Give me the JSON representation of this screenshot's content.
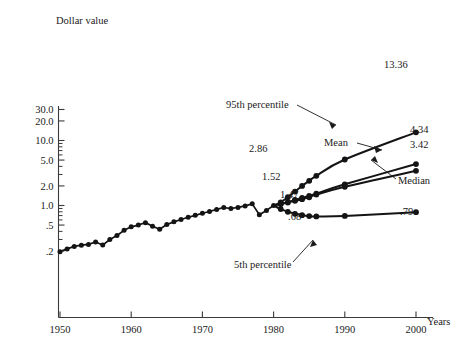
{
  "chart_data": {
    "type": "line",
    "title": "",
    "ylabel": "Dollar value",
    "xlabel": "Years",
    "yscale": "log",
    "ylim": [
      0.17,
      34.0
    ],
    "xlim": [
      1948.5,
      2002.0
    ],
    "grid": false,
    "legend": "annotations",
    "yticks": [
      {
        "value": 30.0,
        "label": "30.0"
      },
      {
        "value": 20.0,
        "label": "20.0"
      },
      {
        "value": 10.0,
        "label": "10.0"
      },
      {
        "value": 5.0,
        "label": "5.0"
      },
      {
        "value": 2.0,
        "label": "2.0"
      },
      {
        "value": 1.0,
        "label": "1.0"
      },
      {
        "value": 0.5,
        "label": ".5"
      },
      {
        "value": 0.2,
        "label": ".2"
      }
    ],
    "yminorticks": [
      9.0,
      8.0,
      7.0,
      6.0,
      4.0,
      3.0,
      0.9,
      0.8,
      0.7,
      0.6,
      0.4,
      0.3
    ],
    "xticks": [
      {
        "value": 1950,
        "label": "1950"
      },
      {
        "value": 1960,
        "label": "1960"
      },
      {
        "value": 1970,
        "label": "1970"
      },
      {
        "value": 1980,
        "label": "1980"
      },
      {
        "value": 1990,
        "label": "1990"
      },
      {
        "value": 2000,
        "label": "2000"
      }
    ],
    "series": [
      {
        "name": "Historical",
        "marker": "filled-circle",
        "x": [
          1950,
          1951,
          1952,
          1953,
          1954,
          1955,
          1956,
          1957,
          1958,
          1959,
          1960,
          1961,
          1962,
          1963,
          1964,
          1965,
          1966,
          1967,
          1968,
          1969,
          1970,
          1971,
          1972,
          1973,
          1974,
          1975,
          1976,
          1977,
          1978,
          1979,
          1980
        ],
        "values": [
          0.195,
          0.215,
          0.235,
          0.245,
          0.252,
          0.275,
          0.246,
          0.3,
          0.345,
          0.415,
          0.47,
          0.5,
          0.545,
          0.48,
          0.43,
          0.51,
          0.56,
          0.61,
          0.66,
          0.705,
          0.76,
          0.81,
          0.87,
          0.93,
          0.9,
          0.935,
          0.985,
          1.06,
          0.72,
          0.84,
          1.0
        ]
      },
      {
        "name": "95th percentile",
        "marker": "filled-circle",
        "x": [
          1980,
          1981,
          1982,
          1983,
          1984,
          1985,
          1986,
          1990,
          2000
        ],
        "values": [
          1.0,
          1.12,
          1.34,
          1.64,
          2.0,
          2.4,
          2.86,
          5.1,
          13.36
        ],
        "end_label": "13.36",
        "mid_label": "2.86"
      },
      {
        "name": "Mean",
        "marker": "filled-circle",
        "x": [
          1980,
          1981,
          1982,
          1983,
          1984,
          1985,
          1986,
          1990,
          2000
        ],
        "values": [
          1.0,
          1.06,
          1.13,
          1.22,
          1.31,
          1.41,
          1.52,
          2.12,
          4.34
        ],
        "end_label": "4.34",
        "mid_label": "1.52"
      },
      {
        "name": "Median",
        "marker": "filled-circle",
        "x": [
          1980,
          1981,
          1982,
          1983,
          1984,
          1985,
          1986,
          1990,
          2000
        ],
        "values": [
          1.0,
          1.05,
          1.11,
          1.18,
          1.25,
          1.34,
          1.47,
          1.94,
          3.42
        ],
        "end_label": "3.42",
        "mid_label": "1.47"
      },
      {
        "name": "5th percentile",
        "marker": "filled-circle",
        "x": [
          1980,
          1981,
          1982,
          1983,
          1984,
          1985,
          1986,
          1990,
          2000
        ],
        "values": [
          1.0,
          0.88,
          0.8,
          0.745,
          0.71,
          0.688,
          0.68,
          0.69,
          0.79
        ],
        "end_label": ".79",
        "mid_label": ".68"
      }
    ],
    "annotations": [
      {
        "text": "95th percentile",
        "x_px": 226,
        "y_px": 108
      },
      {
        "text": "Mean",
        "x_px": 324,
        "y_px": 146
      },
      {
        "text": "Median",
        "x_px": 398,
        "y_px": 184
      },
      {
        "text": "5th percentile",
        "x_px": 234,
        "y_px": 268
      },
      {
        "text": "13.36",
        "x_px": 384,
        "y_px": 68
      },
      {
        "text": "4.34",
        "x_px": 410,
        "y_px": 133
      },
      {
        "text": "3.42",
        "x_px": 410,
        "y_px": 148
      },
      {
        "text": ".79",
        "x_px": 400,
        "y_px": 215
      },
      {
        "text": "2.86",
        "x_px": 249,
        "y_px": 152
      },
      {
        "text": "1.52",
        "x_px": 262,
        "y_px": 180
      },
      {
        "text": "1.47",
        "x_px": 280,
        "y_px": 198
      },
      {
        "text": ".68",
        "x_px": 288,
        "y_px": 220
      }
    ],
    "colors": {
      "line": "#141414",
      "axis": "#3a3a3a",
      "text": "#1a1a1a",
      "background": "#ffffff"
    }
  }
}
